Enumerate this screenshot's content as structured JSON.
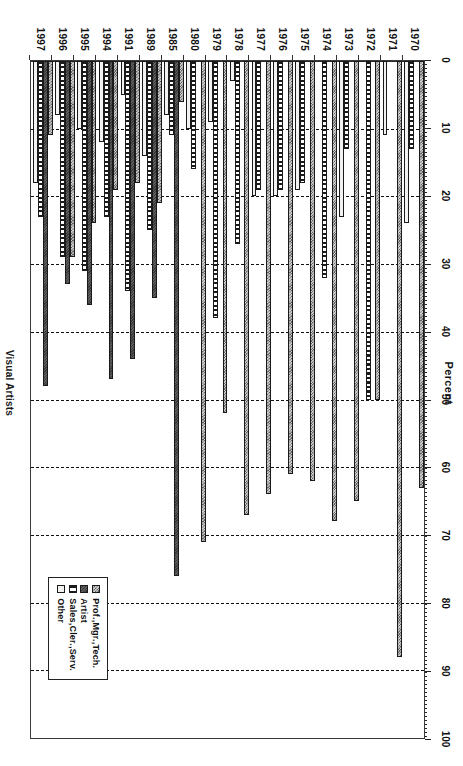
{
  "chart_data": {
    "type": "bar",
    "orientation": "horizontal",
    "title": "Visual Artists",
    "xlabel": "Percent",
    "ylabel": "",
    "xlim": [
      0,
      100
    ],
    "xticks": [
      0,
      10,
      20,
      30,
      40,
      50,
      60,
      70,
      80,
      90,
      100
    ],
    "grid": true,
    "legend_position": "bottom-right",
    "categories": [
      "1970",
      "1971",
      "1972",
      "1973",
      "1974",
      "1975",
      "1976",
      "1977",
      "1978",
      "1979",
      "1980",
      "1985",
      "1989",
      "1991",
      "1994",
      "1995",
      "1996",
      "1997"
    ],
    "series": [
      {
        "name": "Prof.,Mgr.,Tech.",
        "color": "#9a9a9a",
        "values": [
          63,
          88,
          50,
          65,
          68,
          62,
          61,
          64,
          67,
          52,
          71,
          6,
          21,
          18,
          19,
          24,
          29,
          11
        ]
      },
      {
        "name": "Artist",
        "color": "#3a3a3a",
        "values": [
          0,
          0,
          0,
          0,
          0,
          0,
          0,
          0,
          0,
          0,
          0,
          76,
          35,
          44,
          47,
          36,
          33,
          48
        ]
      },
      {
        "name": "Sales,Cler.,Serv.",
        "color": "#1b1b1b",
        "values": [
          13,
          0,
          50,
          13,
          32,
          18,
          19,
          19,
          27,
          38,
          16,
          11,
          25,
          34,
          23,
          31,
          29,
          23
        ]
      },
      {
        "name": "Other",
        "color": "#f2f2f0",
        "values": [
          24,
          11,
          0,
          23,
          0,
          19,
          20,
          20,
          3,
          9,
          10,
          8,
          14,
          5,
          12,
          10,
          8,
          18
        ]
      }
    ]
  },
  "axis": {
    "value_axis_title": "Percent",
    "tick_labels": [
      "0",
      "10",
      "20",
      "30",
      "40",
      "50",
      "60",
      "70",
      "80",
      "90",
      "100"
    ]
  },
  "legend": {
    "entries": [
      {
        "label": "Prof.,Mgr.,Tech."
      },
      {
        "label": "Artist"
      },
      {
        "label": "Sales,Cler.,Serv."
      },
      {
        "label": "Other"
      }
    ]
  },
  "footer": {
    "title": "Visual Artists"
  }
}
